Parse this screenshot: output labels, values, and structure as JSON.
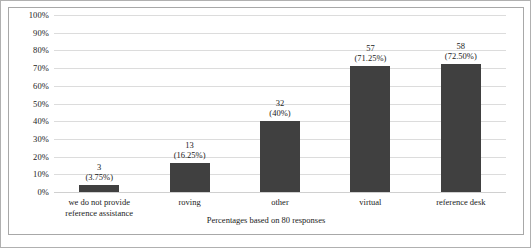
{
  "chart_data": {
    "type": "bar",
    "title": "",
    "subtitle": "",
    "xlabel": "",
    "ylabel": "",
    "caption": "Percentages based on 80 responses",
    "ylim": [
      0,
      100
    ],
    "ytick_labels": [
      "100%",
      "90%",
      "80%",
      "70%",
      "60%",
      "50%",
      "40%",
      "30%",
      "20%",
      "10%",
      "0%"
    ],
    "ytick_values": [
      100,
      90,
      80,
      70,
      60,
      50,
      40,
      30,
      20,
      10,
      0
    ],
    "grid": true,
    "legend": "none",
    "total_responses": 80,
    "categories": [
      "we do not provide\nreference assistance",
      "roving",
      "other",
      "virtual",
      "reference desk"
    ],
    "counts": [
      3,
      13,
      32,
      57,
      58
    ],
    "values": [
      3.75,
      16.25,
      40,
      71.25,
      72.5
    ],
    "bars": [
      {
        "category_line1": "we do not provide",
        "category_line2": "reference assistance",
        "count_label": "3",
        "percent_label": "(3.75%)",
        "count": 3,
        "percent": 3.75
      },
      {
        "category_line1": "roving",
        "category_line2": "",
        "count_label": "13",
        "percent_label": "(16.25%)",
        "count": 13,
        "percent": 16.25
      },
      {
        "category_line1": "other",
        "category_line2": "",
        "count_label": "32",
        "percent_label": "(40%)",
        "count": 32,
        "percent": 40
      },
      {
        "category_line1": "virtual",
        "category_line2": "",
        "count_label": "57",
        "percent_label": "(71.25%)",
        "count": 57,
        "percent": 71.25
      },
      {
        "category_line1": "reference desk",
        "category_line2": "",
        "count_label": "58",
        "percent_label": "(72.50%)",
        "count": 58,
        "percent": 72.5
      }
    ],
    "colors": {
      "bar": "#404040",
      "gridline": "#dcdcdc",
      "frame": "#a8a8a8",
      "outer_border": "#b0b0b0",
      "background": "#ffffff",
      "text": "#1a1a1a"
    }
  }
}
